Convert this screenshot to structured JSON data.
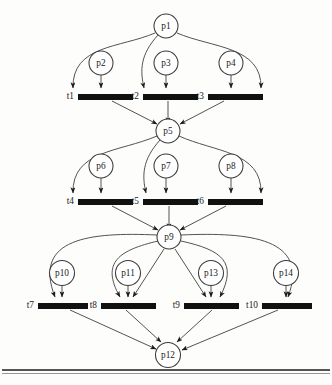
{
  "diagram": {
    "type": "petri-net",
    "width": 332,
    "height": 385,
    "colors": {
      "background": "#fdfdfc",
      "place_stroke": "#3b3b3b",
      "place_fill": "#ffffff",
      "transition_fill": "#111111",
      "arc_stroke": "#4a4a4a",
      "text": "#1a1a1a"
    }
  },
  "places": [
    {
      "id": "p1",
      "label": "p1",
      "cx": 166,
      "cy": 26,
      "r": 12
    },
    {
      "id": "p2",
      "label": "p2",
      "cx": 101,
      "cy": 63,
      "r": 12
    },
    {
      "id": "p3",
      "label": "p3",
      "cx": 166,
      "cy": 63,
      "r": 12
    },
    {
      "id": "p4",
      "label": "p4",
      "cx": 231,
      "cy": 63,
      "r": 12
    },
    {
      "id": "p5",
      "label": "p5",
      "cx": 168,
      "cy": 131,
      "r": 12
    },
    {
      "id": "p6",
      "label": "p6",
      "cx": 101,
      "cy": 166,
      "r": 12
    },
    {
      "id": "p7",
      "label": "p7",
      "cx": 166,
      "cy": 166,
      "r": 12
    },
    {
      "id": "p8",
      "label": "p8",
      "cx": 231,
      "cy": 166,
      "r": 12
    },
    {
      "id": "p9",
      "label": "p9",
      "cx": 169,
      "cy": 237,
      "r": 12
    },
    {
      "id": "p10",
      "label": "p10",
      "cx": 62,
      "cy": 273,
      "r": 12.5
    },
    {
      "id": "p11",
      "label": "p11",
      "cx": 128,
      "cy": 273,
      "r": 12.5
    },
    {
      "id": "p13",
      "label": "p13",
      "cx": 211,
      "cy": 273,
      "r": 12.5
    },
    {
      "id": "p14",
      "label": "p14",
      "cx": 286,
      "cy": 273,
      "r": 12.5
    },
    {
      "id": "p12",
      "label": "p12",
      "cx": 168,
      "cy": 355,
      "r": 12.5
    }
  ],
  "transitions": [
    {
      "id": "t1",
      "label": "t1",
      "x": 78,
      "y": 94,
      "w": 55,
      "h": 6,
      "label_x": 74,
      "label_y": 97
    },
    {
      "id": "t2",
      "label": "t2",
      "x": 143,
      "y": 94,
      "w": 55,
      "h": 6,
      "label_x": 139,
      "label_y": 97
    },
    {
      "id": "t3",
      "label": "t3",
      "x": 208,
      "y": 94,
      "w": 55,
      "h": 6,
      "label_x": 204,
      "label_y": 97
    },
    {
      "id": "t4",
      "label": "t4",
      "x": 78,
      "y": 199,
      "w": 55,
      "h": 6,
      "label_x": 74,
      "label_y": 202
    },
    {
      "id": "t5",
      "label": "t5",
      "x": 143,
      "y": 199,
      "w": 55,
      "h": 6,
      "label_x": 139,
      "label_y": 202
    },
    {
      "id": "t6",
      "label": "t6",
      "x": 208,
      "y": 199,
      "w": 55,
      "h": 6,
      "label_x": 204,
      "label_y": 202
    },
    {
      "id": "t7",
      "label": "t7",
      "x": 38,
      "y": 303,
      "w": 50,
      "h": 6,
      "label_x": 34,
      "label_y": 306
    },
    {
      "id": "t8",
      "label": "t8",
      "x": 101,
      "y": 303,
      "w": 55,
      "h": 6,
      "label_x": 97,
      "label_y": 306
    },
    {
      "id": "t9",
      "label": "t9",
      "x": 184,
      "y": 303,
      "w": 55,
      "h": 6,
      "label_x": 180,
      "label_y": 306
    },
    {
      "id": "t10",
      "label": "t10",
      "x": 262,
      "y": 303,
      "w": 50,
      "h": 6,
      "label_x": 258,
      "label_y": 306
    }
  ],
  "arcs": [
    {
      "from": "p1",
      "to": "t1",
      "kind": "curve-left",
      "d": "M 155,33 C 120,48 72,45 73,88"
    },
    {
      "from": "p1",
      "to": "t2",
      "kind": "curve-left",
      "d": "M 158,35 C 140,55 140,70 144,88"
    },
    {
      "from": "p1",
      "to": "t3",
      "kind": "curve-right",
      "d": "M 177,33 C 212,48 262,46 261,88"
    },
    {
      "from": "p2",
      "to": "t1",
      "kind": "straight",
      "d": "M 101,75 L 101,88"
    },
    {
      "from": "p3",
      "to": "t2",
      "kind": "straight",
      "d": "M 166,75 L 166,88"
    },
    {
      "from": "p4",
      "to": "t3",
      "kind": "straight",
      "d": "M 231,75 L 231,88"
    },
    {
      "from": "t1",
      "to": "p5",
      "kind": "diagonal",
      "d": "M 112,101 L 157,124"
    },
    {
      "from": "t2",
      "to": "p5",
      "kind": "straight",
      "d": "M 168,101 L 168,123"
    },
    {
      "from": "t3",
      "to": "p5",
      "kind": "diagonal",
      "d": "M 224,101 L 180,124"
    },
    {
      "from": "p5",
      "to": "t4",
      "kind": "curve-left",
      "d": "M 157,136 C 120,152 72,150 73,193"
    },
    {
      "from": "p5",
      "to": "t5",
      "kind": "curve-left",
      "d": "M 160,140 C 142,160 142,176 146,193"
    },
    {
      "from": "p5",
      "to": "t6",
      "kind": "curve-right",
      "d": "M 179,136 C 214,152 262,151 261,193"
    },
    {
      "from": "p6",
      "to": "t4",
      "kind": "straight",
      "d": "M 101,178 L 101,193"
    },
    {
      "from": "p7",
      "to": "t5",
      "kind": "straight",
      "d": "M 166,178 L 166,193"
    },
    {
      "from": "p8",
      "to": "t6",
      "kind": "straight",
      "d": "M 231,178 L 231,193"
    },
    {
      "from": "t4",
      "to": "p9",
      "kind": "diagonal",
      "d": "M 112,206 L 158,230"
    },
    {
      "from": "t5",
      "to": "p9",
      "kind": "straight",
      "d": "M 169,206 L 169,229"
    },
    {
      "from": "t6",
      "to": "p9",
      "kind": "diagonal",
      "d": "M 226,206 L 180,230"
    },
    {
      "from": "p9",
      "to": "t7",
      "kind": "curve-left",
      "d": "M 157,235 C 90,232 32,238 55,297"
    },
    {
      "from": "p9",
      "to": "t8",
      "kind": "curve-left",
      "d": "M 158,241 C 120,250 100,262 120,297"
    },
    {
      "from": "p9",
      "to": "t8",
      "kind": "diagonal",
      "d": "M 164,249 L 133,297"
    },
    {
      "from": "p9",
      "to": "t9",
      "kind": "diagonal",
      "d": "M 175,249 L 206,297"
    },
    {
      "from": "p9",
      "to": "t9",
      "kind": "curve-right",
      "d": "M 181,241 C 222,250 238,262 220,297"
    },
    {
      "from": "p9",
      "to": "t10",
      "kind": "curve-right",
      "d": "M 181,235 C 250,232 310,238 288,297"
    },
    {
      "from": "p10",
      "to": "t7",
      "kind": "straight",
      "d": "M 62,286 L 62,297"
    },
    {
      "from": "p11",
      "to": "t8",
      "kind": "straight",
      "d": "M 128,286 L 128,297"
    },
    {
      "from": "p13",
      "to": "t9",
      "kind": "straight",
      "d": "M 211,286 L 211,297"
    },
    {
      "from": "p14",
      "to": "t10",
      "kind": "straight",
      "d": "M 286,286 L 286,297"
    },
    {
      "from": "t7",
      "to": "p12",
      "kind": "diagonal",
      "d": "M 70,310 L 156,349"
    },
    {
      "from": "t8",
      "to": "p12",
      "kind": "diagonal",
      "d": "M 126,310 L 161,342"
    },
    {
      "from": "t9",
      "to": "p12",
      "kind": "diagonal",
      "d": "M 212,310 L 177,342"
    },
    {
      "from": "t10",
      "to": "p12",
      "kind": "diagonal",
      "d": "M 278,310 L 182,350"
    }
  ],
  "footer": {
    "rule": "horizontal-rule"
  }
}
